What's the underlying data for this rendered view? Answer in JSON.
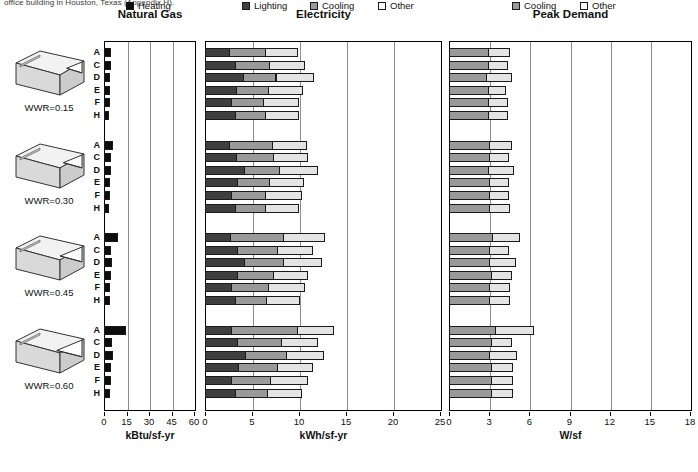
{
  "caption": "office building in Houston, Texas (Appendix H).",
  "groups": [
    "WWR=0.15",
    "WWR=0.30",
    "WWR=0.45",
    "WWR=0.60"
  ],
  "row_labels": [
    "A",
    "C",
    "D",
    "E",
    "F",
    "H"
  ],
  "legend": {
    "left": [
      {
        "label": "Heating",
        "color": "#0d0d0d",
        "key": "heating"
      }
    ],
    "right": [
      {
        "label": "Lighting",
        "color": "#3f3f3f",
        "key": "lighting"
      },
      {
        "label": "Cooling",
        "color": "#9a9a9a",
        "key": "cooling"
      },
      {
        "label": "Other",
        "color": "#ffffff",
        "key": "other"
      }
    ],
    "far_right": [
      {
        "label": "Cooling",
        "color": "#9a9a9a",
        "key": "cooling"
      },
      {
        "label": "Other",
        "color": "#ffffff",
        "key": "other"
      }
    ]
  },
  "chart_data": [
    {
      "type": "bar",
      "orientation": "horizontal",
      "stacked": true,
      "title": "Natural Gas",
      "xlabel": "kBtu/sf-yr",
      "ylabel": "",
      "xlim": [
        0,
        60
      ],
      "xticks": [
        0,
        15,
        30,
        45,
        60
      ],
      "grid": true,
      "legend_position": "bottom",
      "series": [
        {
          "name": "Heating",
          "color": "#0d0d0d"
        }
      ],
      "groups": [
        {
          "name": "WWR=0.15",
          "categories": [
            "A",
            "C",
            "D",
            "E",
            "F",
            "H"
          ],
          "values": [
            4.0,
            3.8,
            3.6,
            3.2,
            3.4,
            2.6
          ]
        },
        {
          "name": "WWR=0.30",
          "categories": [
            "A",
            "C",
            "D",
            "E",
            "F",
            "H"
          ],
          "values": [
            5.4,
            4.0,
            4.2,
            3.6,
            3.4,
            2.8
          ]
        },
        {
          "name": "WWR=0.45",
          "categories": [
            "A",
            "C",
            "D",
            "E",
            "F",
            "H"
          ],
          "values": [
            8.6,
            4.2,
            4.6,
            3.8,
            3.6,
            3.0
          ]
        },
        {
          "name": "WWR=0.60",
          "categories": [
            "A",
            "C",
            "D",
            "E",
            "F",
            "H"
          ],
          "values": [
            14.2,
            4.4,
            5.2,
            4.0,
            3.8,
            3.0
          ]
        }
      ]
    },
    {
      "type": "bar",
      "orientation": "horizontal",
      "stacked": true,
      "title": "Electricity",
      "xlabel": "kWh/sf-yr",
      "ylabel": "",
      "xlim": [
        0,
        25
      ],
      "xticks": [
        0,
        5,
        10,
        15,
        20,
        25
      ],
      "grid": true,
      "legend_position": "bottom",
      "series": [
        {
          "name": "Lighting",
          "color": "#3f3f3f"
        },
        {
          "name": "Cooling",
          "color": "#9a9a9a"
        },
        {
          "name": "Other",
          "color": "#e4e4e4"
        }
      ],
      "groups": [
        {
          "name": "WWR=0.15",
          "categories": [
            "A",
            "C",
            "D",
            "E",
            "F",
            "H"
          ],
          "stacks": [
            {
              "category": "A",
              "values": [
                2.6,
                3.8,
                3.4
              ]
            },
            {
              "category": "C",
              "values": [
                3.2,
                3.6,
                3.7
              ]
            },
            {
              "category": "D",
              "values": [
                4.0,
                3.5,
                4.0
              ]
            },
            {
              "category": "E",
              "values": [
                3.3,
                3.4,
                3.6
              ]
            },
            {
              "category": "F",
              "values": [
                2.8,
                3.4,
                3.7
              ]
            },
            {
              "category": "H",
              "values": [
                3.2,
                3.2,
                3.5
              ]
            }
          ]
        },
        {
          "name": "WWR=0.30",
          "categories": [
            "A",
            "C",
            "D",
            "E",
            "F",
            "H"
          ],
          "stacks": [
            {
              "category": "A",
              "values": [
                2.6,
                4.5,
                3.6
              ]
            },
            {
              "category": "C",
              "values": [
                3.3,
                3.9,
                3.6
              ]
            },
            {
              "category": "D",
              "values": [
                4.2,
                3.7,
                4.0
              ]
            },
            {
              "category": "E",
              "values": [
                3.4,
                3.4,
                3.6
              ]
            },
            {
              "category": "F",
              "values": [
                2.8,
                3.6,
                3.8
              ]
            },
            {
              "category": "H",
              "values": [
                3.2,
                3.2,
                3.5
              ]
            }
          ]
        },
        {
          "name": "WWR=0.45",
          "categories": [
            "A",
            "C",
            "D",
            "E",
            "F",
            "H"
          ],
          "stacks": [
            {
              "category": "A",
              "values": [
                2.7,
                5.6,
                4.4
              ]
            },
            {
              "category": "C",
              "values": [
                3.4,
                4.3,
                3.7
              ]
            },
            {
              "category": "D",
              "values": [
                4.2,
                4.1,
                4.0
              ]
            },
            {
              "category": "E",
              "values": [
                3.4,
                3.8,
                3.7
              ]
            },
            {
              "category": "F",
              "values": [
                2.8,
                3.9,
                3.8
              ]
            },
            {
              "category": "H",
              "values": [
                3.2,
                3.3,
                3.5
              ]
            }
          ]
        },
        {
          "name": "WWR=0.60",
          "categories": [
            "A",
            "C",
            "D",
            "E",
            "F",
            "H"
          ],
          "stacks": [
            {
              "category": "A",
              "values": [
                2.8,
                7.0,
                3.8
              ]
            },
            {
              "category": "C",
              "values": [
                3.4,
                4.7,
                3.8
              ]
            },
            {
              "category": "D",
              "values": [
                4.3,
                4.3,
                4.0
              ]
            },
            {
              "category": "E",
              "values": [
                3.5,
                4.2,
                3.7
              ]
            },
            {
              "category": "F",
              "values": [
                2.8,
                4.1,
                3.9
              ]
            },
            {
              "category": "H",
              "values": [
                3.2,
                3.4,
                3.6
              ]
            }
          ]
        }
      ]
    },
    {
      "type": "bar",
      "orientation": "horizontal",
      "stacked": true,
      "title": "Peak Demand",
      "xlabel": "W/sf",
      "ylabel": "",
      "xlim": [
        0,
        18
      ],
      "xticks": [
        0,
        3,
        6,
        9,
        12,
        15,
        18
      ],
      "grid": true,
      "legend_position": "bottom",
      "series": [
        {
          "name": "Cooling",
          "color": "#9a9a9a"
        },
        {
          "name": "Other",
          "color": "#e4e4e4"
        }
      ],
      "groups": [
        {
          "name": "WWR=0.15",
          "categories": [
            "A",
            "C",
            "D",
            "E",
            "F",
            "H"
          ],
          "stacks": [
            {
              "category": "A",
              "values": [
                2.9,
                1.6
              ]
            },
            {
              "category": "C",
              "values": [
                2.9,
                1.4
              ]
            },
            {
              "category": "D",
              "values": [
                2.8,
                1.8
              ]
            },
            {
              "category": "E",
              "values": [
                2.9,
                1.3
              ]
            },
            {
              "category": "F",
              "values": [
                2.9,
                1.4
              ]
            },
            {
              "category": "H",
              "values": [
                2.9,
                1.4
              ]
            }
          ]
        },
        {
          "name": "WWR=0.30",
          "categories": [
            "A",
            "C",
            "D",
            "E",
            "F",
            "H"
          ],
          "stacks": [
            {
              "category": "A",
              "values": [
                3.0,
                1.6
              ]
            },
            {
              "category": "C",
              "values": [
                3.0,
                1.4
              ]
            },
            {
              "category": "D",
              "values": [
                2.9,
                1.9
              ]
            },
            {
              "category": "E",
              "values": [
                3.0,
                1.4
              ]
            },
            {
              "category": "F",
              "values": [
                3.0,
                1.4
              ]
            },
            {
              "category": "H",
              "values": [
                3.0,
                1.5
              ]
            }
          ]
        },
        {
          "name": "WWR=0.45",
          "categories": [
            "A",
            "C",
            "D",
            "E",
            "F",
            "H"
          ],
          "stacks": [
            {
              "category": "A",
              "values": [
                3.2,
                2.0
              ]
            },
            {
              "category": "C",
              "values": [
                3.0,
                1.4
              ]
            },
            {
              "category": "D",
              "values": [
                3.0,
                1.9
              ]
            },
            {
              "category": "E",
              "values": [
                3.1,
                1.5
              ]
            },
            {
              "category": "F",
              "values": [
                3.0,
                1.5
              ]
            },
            {
              "category": "H",
              "values": [
                3.0,
                1.5
              ]
            }
          ]
        },
        {
          "name": "WWR=0.60",
          "categories": [
            "A",
            "C",
            "D",
            "E",
            "F",
            "H"
          ],
          "stacks": [
            {
              "category": "A",
              "values": [
                3.4,
                2.9
              ]
            },
            {
              "category": "C",
              "values": [
                3.1,
                1.5
              ]
            },
            {
              "category": "D",
              "values": [
                3.0,
                2.0
              ]
            },
            {
              "category": "E",
              "values": [
                3.1,
                1.6
              ]
            },
            {
              "category": "F",
              "values": [
                3.1,
                1.6
              ]
            },
            {
              "category": "H",
              "values": [
                3.1,
                1.6
              ]
            }
          ]
        }
      ]
    }
  ]
}
